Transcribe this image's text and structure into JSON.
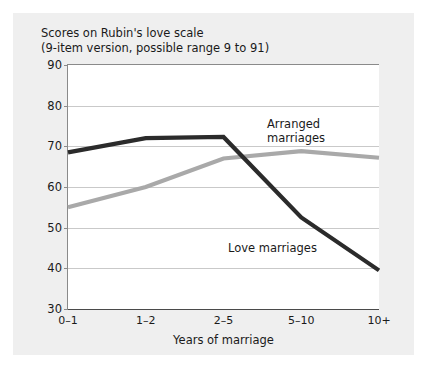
{
  "figure": {
    "title_line1": "Scores on Rubin's love scale",
    "title_line2": "(9-item version, possible range 9 to 91)",
    "background_color": "#efefef",
    "plot_background_color": "#ffffff"
  },
  "annotations": {
    "arranged_line1": "Arranged",
    "arranged_line2": "marriages",
    "love": "Love marriages"
  },
  "chart_data": {
    "type": "line",
    "title": "Scores on Rubin's love scale (9-item version, possible range 9 to 91)",
    "xlabel": "Years of marriage",
    "ylabel": "",
    "categories": [
      "0–1",
      "1–2",
      "2–5",
      "5–10",
      "10+"
    ],
    "ylim": [
      30,
      90
    ],
    "yticks": [
      30,
      40,
      50,
      60,
      70,
      80,
      90
    ],
    "grid": true,
    "legend_position": "inline-annotations",
    "series": [
      {
        "name": "Love marriages",
        "color": "#2b2b2b",
        "values": [
          68.5,
          72.0,
          72.3,
          52.5,
          39.5
        ]
      },
      {
        "name": "Arranged marriages",
        "color": "#a9a9a9",
        "values": [
          55.0,
          60.0,
          67.0,
          68.8,
          67.2
        ]
      }
    ]
  }
}
